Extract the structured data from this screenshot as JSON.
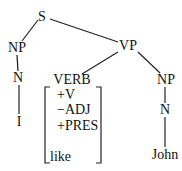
{
  "diagram": {
    "type": "syntax-tree",
    "nodes": {
      "s": "S",
      "np_subj": "NP",
      "n_subj": "N",
      "i": "I",
      "vp": "VP",
      "verb": "VERB",
      "np_obj": "NP",
      "n_obj": "N",
      "john": "John"
    },
    "verb_features": {
      "v": "+V",
      "adj": "−ADJ",
      "pres": "+PRES",
      "word": "like"
    },
    "edges": [
      [
        "S",
        "NP"
      ],
      [
        "S",
        "VP"
      ],
      [
        "NP",
        "N"
      ],
      [
        "N",
        "I"
      ],
      [
        "VP",
        "VERB"
      ],
      [
        "VP",
        "NP"
      ],
      [
        "NP",
        "N"
      ],
      [
        "N",
        "John"
      ]
    ]
  }
}
